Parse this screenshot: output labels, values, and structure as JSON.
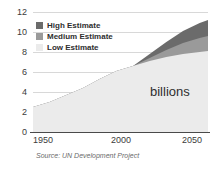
{
  "chart_data": {
    "type": "area",
    "title": "",
    "subtitle": "",
    "xlabel": "",
    "ylabel": "",
    "annotation": "billions",
    "source": "Source: UN Development Project",
    "grid": true,
    "legend_position": "top-left",
    "xlim": [
      1950,
      2055
    ],
    "ylim": [
      0,
      12
    ],
    "xticks": [
      "1950",
      "2000",
      "2050"
    ],
    "xtick_values": [
      1950,
      2000,
      2050
    ],
    "yticks": [
      "0",
      "2",
      "4",
      "6",
      "8",
      "10",
      "12"
    ],
    "ytick_values": [
      0,
      2,
      4,
      6,
      8,
      10,
      12
    ],
    "x": [
      1950,
      1960,
      1970,
      1980,
      1990,
      2000,
      2010,
      2020,
      2030,
      2040,
      2050,
      2055
    ],
    "series": [
      {
        "name": "Low Estimate",
        "color": "#ebebeb",
        "values": [
          2.5,
          3.0,
          3.7,
          4.4,
          5.3,
          6.1,
          6.6,
          7.1,
          7.5,
          7.8,
          8.0,
          8.1
        ]
      },
      {
        "name": "Medium Estimate",
        "color": "#9a9a9a",
        "values": [
          2.5,
          3.0,
          3.7,
          4.4,
          5.3,
          6.1,
          6.6,
          7.4,
          8.2,
          8.9,
          9.4,
          9.6
        ]
      },
      {
        "name": "High Estimate",
        "color": "#6b6b6b",
        "values": [
          2.5,
          3.0,
          3.7,
          4.4,
          5.3,
          6.1,
          6.6,
          7.8,
          9.0,
          10.1,
          10.9,
          11.2
        ]
      }
    ],
    "divergence_year": 2010,
    "divergence_value": 6.6
  },
  "legend": {
    "items": [
      {
        "label": "High Estimate",
        "color": "#6b6b6b"
      },
      {
        "label": "Medium Estimate",
        "color": "#9a9a9a"
      },
      {
        "label": "Low Estimate",
        "color": "#ebebeb"
      }
    ]
  },
  "colors": {
    "high": "#6b6b6b",
    "medium": "#9a9a9a",
    "low": "#ebebeb",
    "grid": "#d8d8d8",
    "axis": "#4a4a4a",
    "text": "#2e2e2e",
    "tick_text": "#3b3b3b",
    "source_text": "#6a6a6a",
    "background": "#ffffff"
  }
}
